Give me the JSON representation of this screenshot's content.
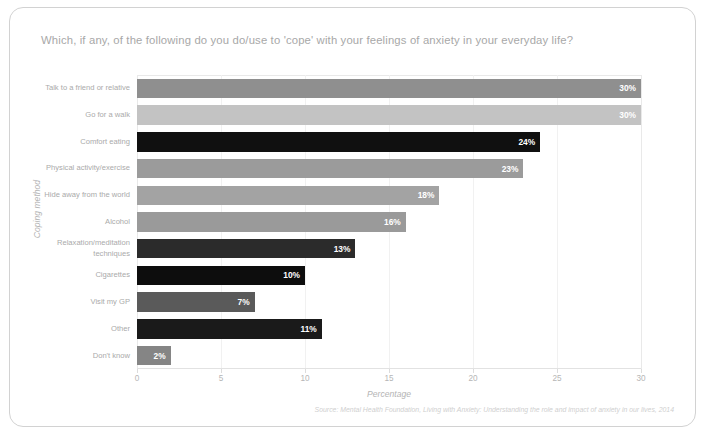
{
  "card": {
    "title": "Which, if any, of the following do you do/use to 'cope' with your feelings of anxiety in your everyday life?",
    "source": "Source: Mental Health Foundation, Living with Anxiety: Understanding the role and impact of anxiety in our lives, 2014"
  },
  "chart_data": {
    "type": "bar",
    "orientation": "horizontal",
    "title": "Which, if any, of the following do you do/use to 'cope' with your feelings of anxiety in your everyday life?",
    "xlabel": "Percentage",
    "ylabel": "Coping method",
    "xlim": [
      0,
      30
    ],
    "ylim": null,
    "grid": true,
    "legend": "none",
    "xticks": [
      0,
      5,
      10,
      15,
      20,
      25,
      30
    ],
    "xtick_labels": [
      "0",
      "5",
      "10",
      "15",
      "20",
      "25",
      "30"
    ],
    "categories": [
      "Talk to a friend or relative",
      "Go for a walk",
      "Comfort eating",
      "Physical activity/exercise",
      "Hide away from the world",
      "Alcohol",
      "Relaxation/meditation techniques",
      "Cigarettes",
      "Visit my GP",
      "Other",
      "Don't know"
    ],
    "values": [
      30,
      30,
      24,
      23,
      18,
      16,
      13,
      10,
      7,
      11,
      2
    ],
    "value_labels": [
      "30%",
      "30%",
      "24%",
      "23%",
      "18%",
      "16%",
      "13%",
      "10%",
      "7%",
      "11%",
      "2%"
    ],
    "bar_colors": [
      "#8f8f8f",
      "#c3c3c3",
      "#101010",
      "#9b9b9b",
      "#a3a3a3",
      "#9a9a9a",
      "#2b2b2b",
      "#0d0d0d",
      "#5a5a5a",
      "#1a1a1a",
      "#858585"
    ]
  },
  "colors": {
    "card_border": "#d2d2d2",
    "title_text": "#a8a8a8",
    "axis_text": "#b4b4b4",
    "source_text": "#cfcfcf",
    "gridline": "#f1f1f1"
  }
}
